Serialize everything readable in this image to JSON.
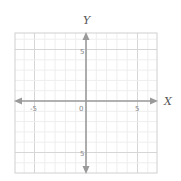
{
  "chart_data": {
    "type": "scatter",
    "title": "",
    "xlabel": "X",
    "ylabel": "Y",
    "xlim": [
      -7,
      7
    ],
    "ylim": [
      -7,
      7
    ],
    "grid": true,
    "grid_minor_step": 1,
    "grid_major_step": 5,
    "x_tick_labels": [
      "-5",
      "0",
      "5"
    ],
    "y_tick_labels": [
      "5",
      "-5"
    ],
    "origin_label": "0",
    "series": [],
    "colors": {
      "axis": "#9a9a9a",
      "grid_minor": "#eeeeee",
      "grid_major": "#d6d6d6",
      "border": "#d0d0d0"
    }
  },
  "labels": {
    "x_axis": "X",
    "y_axis": "Y",
    "x_neg5": "-5",
    "x_zero": "0",
    "x_pos5": "5",
    "y_pos5": "5",
    "y_neg5": "5"
  }
}
